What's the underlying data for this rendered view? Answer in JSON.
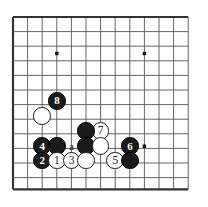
{
  "figure": {
    "type": "go-board-diagram",
    "board": {
      "origin_x": 13,
      "origin_y": 17,
      "spacing": 14.6,
      "cols": 13,
      "rows": 12,
      "edges": [
        "left",
        "top",
        "bottom"
      ],
      "line_color": "#555555",
      "edge_color": "#333333",
      "background_color": "#ffffff",
      "star_points": [
        {
          "col": 3,
          "row": 2.5
        },
        {
          "col": 9,
          "row": 2.5
        },
        {
          "col": 9,
          "row": 8.85
        }
      ]
    },
    "stones": [
      {
        "id": "white-unnumbered-upper",
        "color": "white",
        "label": "",
        "col": 2,
        "row": 6.78
      },
      {
        "id": "black-move-8",
        "color": "black",
        "label": "8",
        "col": 3,
        "row": 5.75
      },
      {
        "id": "white-move-7",
        "color": "white",
        "label": "7",
        "col": 6,
        "row": 7.81
      },
      {
        "id": "black-unnumbered-upper-center",
        "color": "black",
        "label": "",
        "col": 5,
        "row": 7.81
      },
      {
        "id": "black-move-4",
        "color": "black",
        "label": "4",
        "col": 2,
        "row": 8.85
      },
      {
        "id": "black-unnumbered-left",
        "color": "black",
        "label": "",
        "col": 3,
        "row": 8.85
      },
      {
        "id": "black-unnumbered-center",
        "color": "black",
        "label": "",
        "col": 5,
        "row": 8.85
      },
      {
        "id": "white-unnumbered-center",
        "color": "white",
        "label": "",
        "col": 6,
        "row": 8.85
      },
      {
        "id": "black-move-6",
        "color": "black",
        "label": "6",
        "col": 8,
        "row": 8.85
      },
      {
        "id": "black-move-2",
        "color": "black",
        "label": "2",
        "col": 2,
        "row": 9.83
      },
      {
        "id": "white-move-1",
        "color": "white",
        "label": "1",
        "col": 3,
        "row": 9.83
      },
      {
        "id": "white-move-3",
        "color": "white",
        "label": "3",
        "col": 4,
        "row": 9.83
      },
      {
        "id": "white-unnumbered-lower",
        "color": "white",
        "label": "",
        "col": 5,
        "row": 9.83
      },
      {
        "id": "white-move-5",
        "color": "white",
        "label": "5",
        "col": 7,
        "row": 9.83
      },
      {
        "id": "black-unnumbered-right",
        "color": "black",
        "label": "",
        "col": 8,
        "row": 9.83
      }
    ],
    "point_labels": [
      {
        "id": "point-a",
        "label": "a",
        "col": 4,
        "row": 8.85
      }
    ]
  }
}
